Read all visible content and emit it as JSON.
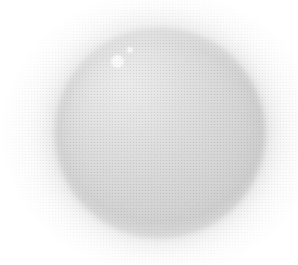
{
  "image": {
    "kind": "scanned-halftone-photograph",
    "subject": "sphere",
    "alt_text": "Light grey sphere with two small white specular highlights on a white background",
    "width": 298,
    "height": 265,
    "background_color": "#ffffff",
    "has_text": false,
    "caption": ""
  },
  "sphere": {
    "label": "sphere",
    "center_x": 160,
    "center_y": 133,
    "radius": 105,
    "bounds": {
      "left": 55,
      "top": 28,
      "right": 265,
      "bottom": 238
    },
    "fill_color": "#dedede",
    "core_color": "#d6d6d6",
    "rim_color": "#cfcfcf",
    "lit_color": "#e9e9e9",
    "edge_softness_px": 8
  },
  "halo": {
    "label": "outer-glow",
    "center_x": 160,
    "center_y": 133,
    "radius": 110,
    "color": "#d9d9d9",
    "blur_px": 14,
    "opacity": 0.75
  },
  "highlights": [
    {
      "label": "primary-specular-highlight",
      "center_x": 117,
      "center_y": 61,
      "radius": 6.5,
      "color": "#ffffff"
    },
    {
      "label": "secondary-specular-highlight",
      "center_x": 130,
      "center_y": 50,
      "radius": 3.2,
      "color": "#ffffff"
    }
  ],
  "texture": {
    "label": "halftone-dot-screen",
    "cell_size_px": 3,
    "dot_color": "#787878",
    "opacity": 0.38
  },
  "grain": {
    "label": "paper-scan-grain",
    "opacity": 0.16
  }
}
